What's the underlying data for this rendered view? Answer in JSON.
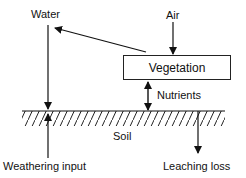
{
  "diagram": {
    "type": "nutrient-cycle-flow",
    "nodes": {
      "water": "Water",
      "air": "Air",
      "vegetation": "Vegetation",
      "soil": "Soil"
    },
    "edges": {
      "nutrients": "Nutrients",
      "weathering": "Weathering input",
      "leaching": "Leaching loss"
    },
    "colors": {
      "stroke": "#111111",
      "background": "#ffffff"
    }
  }
}
